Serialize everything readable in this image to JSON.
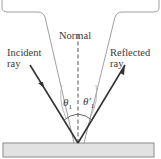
{
  "labels": {
    "normal": "Normal",
    "incident_line1": "Incident",
    "incident_line2": "ray",
    "reflected_line1": "Reflected",
    "reflected_line2": "ray",
    "theta_incident": "θ",
    "theta_incident_sub": "1",
    "theta_reflected": "θ′",
    "theta_reflected_sub": "1"
  },
  "colors": {
    "ray": "#333333",
    "normal": "#555555",
    "surface_fill": "#e2e2e2",
    "surface_stroke": "#8a8a8a",
    "outline": "#9a9a9a"
  }
}
